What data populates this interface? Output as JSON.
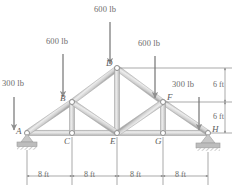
{
  "figure": {
    "type": "truss-free-body-diagram"
  },
  "loads": [
    {
      "id": "load-a",
      "label": "300 lb",
      "at_joint": "A",
      "direction": "down",
      "magnitude": 300,
      "unit": "lb"
    },
    {
      "id": "load-b",
      "label": "600 lb",
      "at_joint": "B",
      "direction": "down",
      "magnitude": 600,
      "unit": "lb"
    },
    {
      "id": "load-d",
      "label": "600 lb",
      "at_joint": "D",
      "direction": "down",
      "magnitude": 600,
      "unit": "lb"
    },
    {
      "id": "load-f",
      "label": "600 lb",
      "at_joint": "F",
      "direction": "down",
      "magnitude": 600,
      "unit": "lb"
    },
    {
      "id": "load-h",
      "label": "300 lb",
      "at_joint": "H",
      "direction": "down",
      "magnitude": 300,
      "unit": "lb"
    }
  ],
  "joints": [
    {
      "id": "A",
      "label": "A",
      "x": 27,
      "y": 133,
      "support": "pin"
    },
    {
      "id": "B",
      "label": "B",
      "x": 72,
      "y": 102,
      "support": "none"
    },
    {
      "id": "C",
      "label": "C",
      "x": 72,
      "y": 133,
      "support": "none"
    },
    {
      "id": "D",
      "label": "D",
      "x": 117,
      "y": 68,
      "support": "none"
    },
    {
      "id": "E",
      "label": "E",
      "x": 117,
      "y": 133,
      "support": "none"
    },
    {
      "id": "F",
      "label": "F",
      "x": 163,
      "y": 102,
      "support": "none"
    },
    {
      "id": "G",
      "label": "G",
      "x": 163,
      "y": 133,
      "support": "none"
    },
    {
      "id": "H",
      "label": "H",
      "x": 208,
      "y": 133,
      "support": "roller"
    }
  ],
  "members": [
    {
      "from": "A",
      "to": "C"
    },
    {
      "from": "C",
      "to": "E"
    },
    {
      "from": "E",
      "to": "G"
    },
    {
      "from": "G",
      "to": "H"
    },
    {
      "from": "A",
      "to": "B"
    },
    {
      "from": "B",
      "to": "D"
    },
    {
      "from": "D",
      "to": "F"
    },
    {
      "from": "F",
      "to": "H"
    },
    {
      "from": "B",
      "to": "C"
    },
    {
      "from": "D",
      "to": "E"
    },
    {
      "from": "F",
      "to": "G"
    },
    {
      "from": "B",
      "to": "E"
    },
    {
      "from": "F",
      "to": "E"
    }
  ],
  "dimensions": {
    "horizontal": [
      {
        "id": "span-ac",
        "label": "8 ft",
        "value": 8,
        "unit": "ft"
      },
      {
        "id": "span-ce",
        "label": "8 ft",
        "value": 8,
        "unit": "ft"
      },
      {
        "id": "span-eg",
        "label": "8 ft",
        "value": 8,
        "unit": "ft"
      },
      {
        "id": "span-gh",
        "label": "8 ft",
        "value": 8,
        "unit": "ft"
      }
    ],
    "vertical": [
      {
        "id": "height-upper",
        "label": "6 ft",
        "value": 6,
        "unit": "ft"
      },
      {
        "id": "height-lower",
        "label": "6 ft",
        "value": 6,
        "unit": "ft"
      }
    ]
  },
  "colors": {
    "member_fill": "#d4d4d4",
    "member_edge": "#a9a9a9",
    "member_highlight": "#f2f2f2",
    "arrow": "#8a8a8a",
    "dimension_line": "#6f6f6f",
    "text": "#6d6d6d",
    "support": "#b0b0b0",
    "background": "#ffffff"
  }
}
